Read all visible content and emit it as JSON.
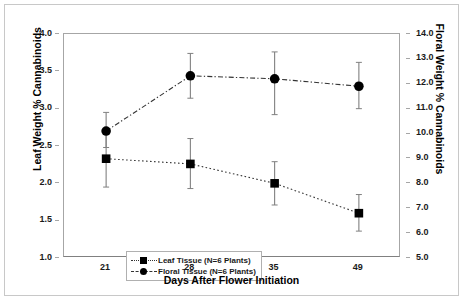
{
  "chart_data": {
    "type": "line",
    "title": "",
    "xlabel": "Days After Flower Initiation",
    "ylabel": "Leaf Weight % Cannabinoids",
    "ylabel_right": "Floral Weight % Cannabinoids",
    "categories": [
      "21",
      "28",
      "35",
      "49"
    ],
    "x": [
      21,
      28,
      35,
      49
    ],
    "ylim": [
      1.0,
      4.0
    ],
    "yticks": [
      "1.0",
      "1.5",
      "2.0",
      "2.5",
      "3.0",
      "3.5",
      "4.0"
    ],
    "ytick_values": [
      1.0,
      1.5,
      2.0,
      2.5,
      3.0,
      3.5,
      4.0
    ],
    "ylim_right": [
      5.0,
      14.0
    ],
    "yticks_right": [
      "5.0",
      "6.0",
      "7.0",
      "8.0",
      "9.0",
      "10.0",
      "11.0",
      "12.0",
      "13.0",
      "14.0"
    ],
    "ytick_values_right": [
      5.0,
      6.0,
      7.0,
      8.0,
      9.0,
      10.0,
      11.0,
      12.0,
      13.0,
      14.0
    ],
    "grid": false,
    "legend_position": "bottom-left",
    "series": [
      {
        "name": "Leaf Tissue (N=6 Plants)",
        "axis": "left",
        "marker": "square",
        "linestyle": "dotted",
        "color": "#000000",
        "values": [
          2.33,
          2.26,
          2.0,
          1.6
        ],
        "error_low": [
          1.95,
          1.93,
          1.71,
          1.36
        ],
        "error_high": [
          2.72,
          2.6,
          2.29,
          1.85
        ]
      },
      {
        "name": "Floral Tissue (N=6 Plants)",
        "axis": "left",
        "marker": "circle",
        "linestyle": "dashdot",
        "color": "#000000",
        "values": [
          2.7,
          3.44,
          3.4,
          3.3
        ],
        "error_low": [
          2.48,
          3.14,
          2.92,
          3.0
        ],
        "error_high": [
          2.95,
          3.74,
          3.76,
          3.62
        ],
        "values_right_axis": [
          10.1,
          12.3,
          12.2,
          11.9
        ]
      }
    ]
  },
  "legend": {
    "items": [
      {
        "label": "Leaf Tissue (N=6 Plants)",
        "marker": "square",
        "linestyle": "dotted"
      },
      {
        "label": "Floral Tissue (N=6 Plants)",
        "marker": "circle",
        "linestyle": "dashdot"
      }
    ]
  },
  "colors": {
    "marker": "#000000",
    "line": "#333333",
    "errorbar": "#808080",
    "axis": "#a6a6a6",
    "frame": "#c8c8c8",
    "text": "#1a1a1a"
  }
}
